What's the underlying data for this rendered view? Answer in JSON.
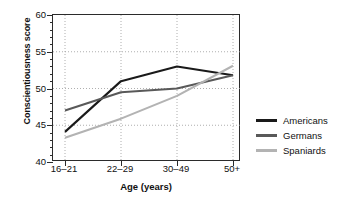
{
  "chart_data": {
    "type": "line",
    "title": "",
    "xlabel": "Age (years)",
    "ylabel": "Conscientiousness score",
    "categories": [
      "16–21",
      "22–29",
      "30–49",
      "50+"
    ],
    "ylim": [
      40,
      60
    ],
    "yticks": [
      40,
      45,
      50,
      55,
      60
    ],
    "ytick_labels": [
      "40",
      "45",
      "50",
      "55",
      "60"
    ],
    "y_minor_step": 1,
    "grid": "dotted major gridlines, horizontal and vertical",
    "legend_position": "right, outside plot",
    "series": [
      {
        "name": "Americans",
        "color": "#1a1a1a",
        "values": [
          44.1,
          51.0,
          53.0,
          51.8
        ]
      },
      {
        "name": "Germans",
        "color": "#595959",
        "values": [
          47.0,
          49.5,
          50.0,
          51.8
        ]
      },
      {
        "name": "Spaniards",
        "color": "#b3b3b3",
        "values": [
          43.3,
          45.9,
          49.0,
          53.1
        ]
      }
    ]
  },
  "legend": {
    "items": [
      {
        "label": "Americans",
        "color": "#1a1a1a"
      },
      {
        "label": "Germans",
        "color": "#595959"
      },
      {
        "label": "Spaniards",
        "color": "#b3b3b3"
      }
    ]
  },
  "axes": {
    "y_title": "Conscientiousness score",
    "x_title": "Age (years)"
  }
}
